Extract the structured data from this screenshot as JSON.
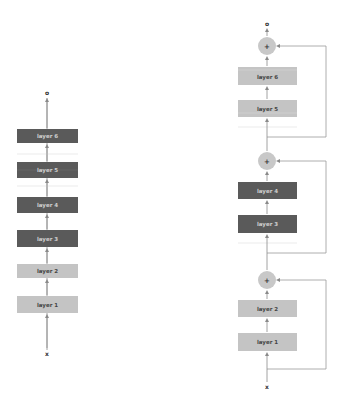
{
  "colors": {
    "dark_box": "#5a5a5a",
    "dark_box_text": "#cfcfcf",
    "light_box": "#c4c4c4",
    "light_box_text": "#444444",
    "arrow": "#8a8a8a",
    "plus_fill": "#c8c8c8",
    "faint_line": "#dedede"
  },
  "left_network": {
    "output_label": "o",
    "input_label": "x",
    "layers": [
      {
        "label": "layer 6",
        "style": "dark"
      },
      {
        "label": "layer 5",
        "style": "dark"
      },
      {
        "label": "layer 4",
        "style": "dark"
      },
      {
        "label": "layer 3",
        "style": "dark"
      },
      {
        "label": "layer 2",
        "style": "light"
      },
      {
        "label": "layer 1",
        "style": "light"
      }
    ]
  },
  "right_network": {
    "output_label": "o",
    "input_label": "x",
    "plus_label": "+",
    "blocks": [
      {
        "layers": [
          {
            "label": "layer 6",
            "style": "light"
          },
          {
            "label": "layer 5",
            "style": "light"
          }
        ]
      },
      {
        "layers": [
          {
            "label": "layer 4",
            "style": "dark"
          },
          {
            "label": "layer 3",
            "style": "dark"
          }
        ]
      },
      {
        "layers": [
          {
            "label": "layer 2",
            "style": "light"
          },
          {
            "label": "layer 1",
            "style": "light"
          }
        ]
      }
    ]
  }
}
